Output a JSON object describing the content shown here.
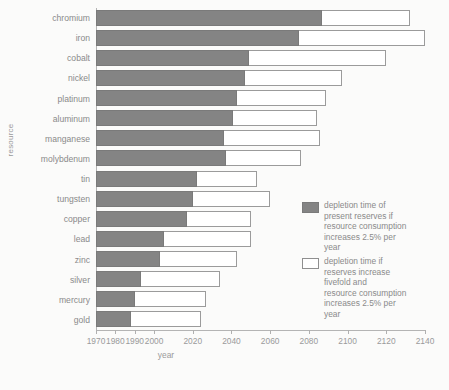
{
  "chart_data": {
    "type": "bar",
    "title": "",
    "xlabel": "year",
    "ylabel": "resource",
    "orientation": "horizontal",
    "grid": false,
    "xlim": [
      1968,
      2145
    ],
    "xticks": [
      1970,
      1980,
      1990,
      2000,
      2020,
      2040,
      2060,
      2080,
      2100,
      2120,
      2140
    ],
    "xtick_labels": [
      "1970",
      "1980",
      "1990",
      "2000",
      "2020",
      "2040",
      "2060",
      "2080",
      "2100",
      "2120",
      "2140"
    ],
    "categories": [
      "chromium",
      "iron",
      "cobalt",
      "nickel",
      "platinum",
      "aluminum",
      "manganese",
      "molybdenum",
      "tin",
      "tungsten",
      "copper",
      "lead",
      "zinc",
      "silver",
      "mercury",
      "gold"
    ],
    "series": [
      {
        "name": "depletion time of present reserves if resource consumption increases 2.5% per year",
        "style": "filled",
        "color": "#848484",
        "values": [
          2087,
          2075,
          2049,
          2047,
          2043,
          2041,
          2036,
          2037,
          2022,
          2020,
          2017,
          2005,
          2003,
          1993,
          1990,
          1988
        ]
      },
      {
        "name": "depletion time if reserves increase fivefold and resource consumption increases 2.5% per year",
        "style": "hollow",
        "color": "#ffffff",
        "values": [
          2132,
          2140,
          2120,
          2097,
          2089,
          2084,
          2086,
          2076,
          2053,
          2060,
          2050,
          2050,
          2043,
          2034,
          2027,
          2024
        ]
      }
    ],
    "legend_position": "right",
    "legend": [
      {
        "swatch": "filled",
        "lines": [
          "depletion time of",
          "present reserves if",
          "resource consumption",
          "increases 2.5% per",
          "year"
        ]
      },
      {
        "swatch": "hollow",
        "lines": [
          "depletion time if",
          "reserves increase",
          "fivefold and",
          "resource consumption",
          "increases 2.5% per",
          "year"
        ]
      }
    ]
  }
}
